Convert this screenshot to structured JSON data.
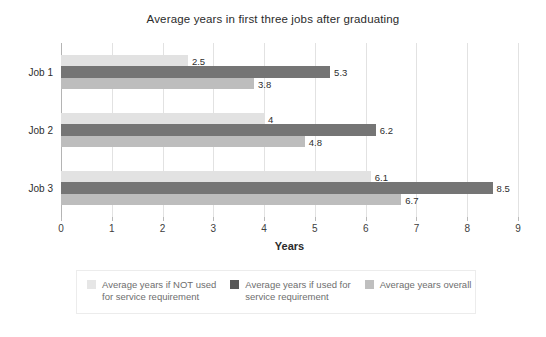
{
  "chart_data": {
    "type": "bar",
    "orientation": "horizontal",
    "title": "Average years in first three jobs after graduating",
    "xlabel": "Years",
    "ylabel": "",
    "xlim": [
      0,
      9
    ],
    "xticks": [
      "0",
      "1",
      "2",
      "3",
      "4",
      "5",
      "6",
      "7",
      "8",
      "9"
    ],
    "grid": true,
    "legend_position": "bottom",
    "categories": [
      "Job 1",
      "Job 2",
      "Job 3"
    ],
    "series": [
      {
        "name": "Average years if NOT used for service requirement",
        "color": "#e2e2e2",
        "values": [
          2.5,
          4,
          6.1
        ],
        "labels": [
          "2.5",
          "4",
          "6.1"
        ]
      },
      {
        "name": "Average years if used for service requirement",
        "color": "#757575",
        "values": [
          5.3,
          6.2,
          8.5
        ],
        "labels": [
          "5.3",
          "6.2",
          "8.5"
        ]
      },
      {
        "name": "Average years overall",
        "color": "#bdbdbd",
        "values": [
          3.8,
          4.8,
          6.7
        ],
        "labels": [
          "3.8",
          "4.8",
          "6.7"
        ]
      }
    ]
  },
  "legend": {
    "items": [
      {
        "label_line1": "Average years if NOT used",
        "label_line2": "for service requirement",
        "color": "#e6e6e6"
      },
      {
        "label_line1": "Average years if used for",
        "label_line2": "service requirement",
        "color": "#595959"
      },
      {
        "label_line1": "Average years overall",
        "label_line2": "",
        "color": "#bfbfbf"
      }
    ]
  }
}
